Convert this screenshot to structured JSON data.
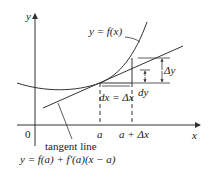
{
  "diagram": {
    "axes": {
      "x_label": "x",
      "y_label": "y",
      "origin_label": "0"
    },
    "curve_label": "y = f(x)",
    "tangent_label": "tangent line",
    "tangent_equation": "y = f(a) + f′(a)(x − a)",
    "x_ticks": [
      "a",
      "a + Δx"
    ],
    "dx_label": "dx = Δx",
    "dy_label": "dy",
    "delta_y_label": "Δy",
    "colors": {
      "stroke": "#333333",
      "text": "#222222",
      "background": "#ffffff"
    }
  }
}
